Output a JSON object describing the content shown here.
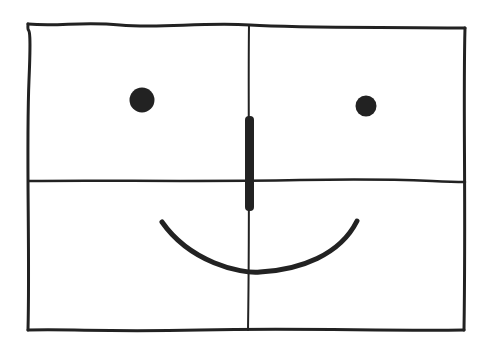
{
  "figure": {
    "stroke_color": "#222222",
    "background": "#ffffff"
  },
  "shapes": {
    "frame": {
      "x1": 28,
      "y1": 24,
      "x2": 465,
      "y2": 330
    },
    "vertical_divider_x": 248,
    "horizontal_divider_y": 181,
    "left_eye": {
      "cx": 142,
      "cy": 100,
      "r": 12
    },
    "right_eye": {
      "cx": 366,
      "cy": 106,
      "r": 10
    },
    "nose": {
      "x": 249,
      "y1": 117,
      "y2": 210,
      "width": 9
    },
    "mouth": {
      "start": [
        162,
        222
      ],
      "end": [
        357,
        221
      ],
      "bottom_y": 272
    }
  }
}
